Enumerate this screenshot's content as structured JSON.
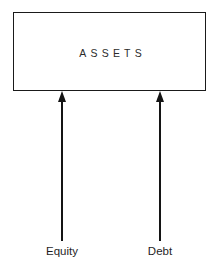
{
  "diagram": {
    "background_color": "#ffffff",
    "line_color": "#141414",
    "text_color": "#1f1f1f",
    "box": {
      "label": "ASSETS"
    },
    "arrows": [
      {
        "name": "equity-arrow",
        "direction": "up",
        "source_label": "Equity",
        "target_label": "ASSETS"
      },
      {
        "name": "debt-arrow",
        "direction": "up",
        "source_label": "Debt",
        "target_label": "ASSETS"
      }
    ],
    "labels": {
      "equity": "Equity",
      "debt": "Debt"
    }
  }
}
